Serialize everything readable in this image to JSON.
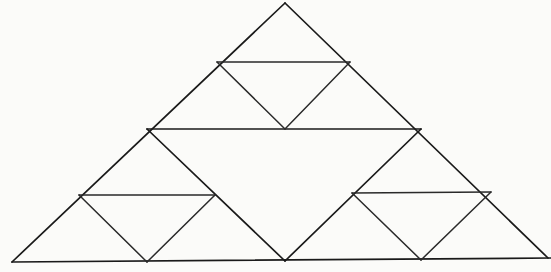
{
  "figure": {
    "kind": "line-drawing",
    "background_color": "#fbfbf9",
    "stroke_color": "#1a1a1a",
    "stroke_width": 1.7,
    "canvas": {
      "width": 551,
      "height": 272
    },
    "iteration_level": 2,
    "counts": {
      "upright_triangles": 9,
      "inverted_triangles": 4,
      "total_vertices": 10
    },
    "vertices": {
      "apex": {
        "name": "apex",
        "x": 285,
        "y": 3
      },
      "bottom_left": {
        "name": "bottom-left",
        "x": 12,
        "y": 262
      },
      "bottom_right": {
        "name": "bottom-right",
        "x": 548,
        "y": 258
      },
      "mid_left": {
        "name": "mid-left",
        "x": 147,
        "y": 129
      },
      "mid_right": {
        "name": "mid-right",
        "x": 421,
        "y": 129
      },
      "mid_bottom": {
        "name": "mid-bottom",
        "x": 285,
        "y": 261
      },
      "top_inv_left": {
        "name": "top-inverted-left",
        "x": 217,
        "y": 62
      },
      "top_inv_right": {
        "name": "top-inverted-right",
        "x": 350,
        "y": 62
      },
      "left_inv_left": {
        "name": "left-inverted-left",
        "x": 79,
        "y": 195
      },
      "left_inv_right": {
        "name": "left-inverted-right",
        "x": 215,
        "y": 195
      },
      "right_inv_left": {
        "name": "right-inverted-left",
        "x": 352,
        "y": 193
      },
      "right_inv_right": {
        "name": "right-inverted-right",
        "x": 491,
        "y": 192
      }
    },
    "outer_triangle": {
      "name": "outer-triangle",
      "points": "285,3 548,258 12,262"
    },
    "center_inverted_triangle": {
      "name": "center-inverted-triangle",
      "points": "147,129 421,129 285,261"
    },
    "top_inverted_triangle": {
      "name": "top-inverted-triangle",
      "points": "217,62 350,62 285,129"
    },
    "left_inverted_triangle": {
      "name": "left-inverted-triangle",
      "points": "79,195 215,195 147,262"
    },
    "right_inverted_triangle": {
      "name": "right-inverted-triangle",
      "points": "352,193 491,192 421,260"
    },
    "segments": [
      {
        "name": "outer-left-edge",
        "x1": 285,
        "y1": 3,
        "x2": 12,
        "y2": 262
      },
      {
        "name": "outer-right-edge",
        "x1": 285,
        "y1": 3,
        "x2": 548,
        "y2": 258
      },
      {
        "name": "outer-base-edge",
        "x1": 12,
        "y1": 262,
        "x2": 551,
        "y2": 258
      },
      {
        "name": "center-top-chord",
        "x1": 147,
        "y1": 129,
        "x2": 421,
        "y2": 129
      },
      {
        "name": "center-left-chord",
        "x1": 147,
        "y1": 129,
        "x2": 285,
        "y2": 261
      },
      {
        "name": "center-right-chord",
        "x1": 421,
        "y1": 129,
        "x2": 285,
        "y2": 261
      },
      {
        "name": "top-inv-top-chord",
        "x1": 217,
        "y1": 62,
        "x2": 350,
        "y2": 62
      },
      {
        "name": "top-inv-left-chord",
        "x1": 217,
        "y1": 62,
        "x2": 285,
        "y2": 129
      },
      {
        "name": "top-inv-right-chord",
        "x1": 350,
        "y1": 62,
        "x2": 285,
        "y2": 129
      },
      {
        "name": "left-inv-top-chord",
        "x1": 79,
        "y1": 195,
        "x2": 215,
        "y2": 195
      },
      {
        "name": "left-inv-left-chord",
        "x1": 79,
        "y1": 195,
        "x2": 147,
        "y2": 262
      },
      {
        "name": "left-inv-right-chord",
        "x1": 215,
        "y1": 195,
        "x2": 147,
        "y2": 262
      },
      {
        "name": "right-inv-top-chord",
        "x1": 352,
        "y1": 193,
        "x2": 491,
        "y2": 192
      },
      {
        "name": "right-inv-left-chord",
        "x1": 352,
        "y1": 193,
        "x2": 421,
        "y2": 260
      },
      {
        "name": "right-inv-right-chord",
        "x1": 491,
        "y1": 192,
        "x2": 421,
        "y2": 260
      }
    ]
  }
}
